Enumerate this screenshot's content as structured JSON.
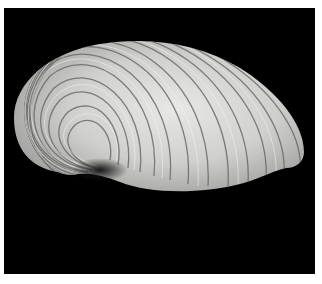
{
  "image": {
    "subject": "Bivalve shell (clam) photographed on black background",
    "caption": "Shell with concentric growth ridges",
    "colors": {
      "background": "#000000",
      "border": "#ffffff",
      "shell_light": "#e4e4e2",
      "shell_mid": "#b8b8b6",
      "shell_dark": "#5a5a58"
    }
  }
}
